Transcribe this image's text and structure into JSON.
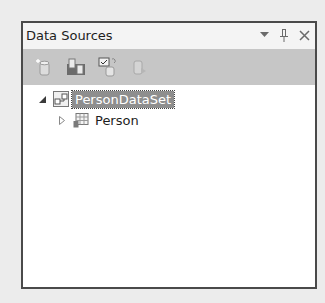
{
  "panel": {
    "title": "Data Sources",
    "title_buttons": [
      {
        "name": "window-position-dropdown",
        "icon": "chevron-down-icon",
        "glyph": "▾"
      },
      {
        "name": "auto-hide-pin",
        "icon": "pin-icon",
        "glyph": "🖈"
      },
      {
        "name": "close",
        "icon": "close-icon",
        "glyph": "✕"
      }
    ]
  },
  "toolbar": {
    "items": [
      {
        "name": "add-new-data-source",
        "icon": "database-add-icon"
      },
      {
        "name": "edit-dataset-with-designer",
        "icon": "dataset-designer-icon"
      },
      {
        "name": "configure-dataset-with-wizard",
        "icon": "dataset-wizard-icon"
      },
      {
        "name": "refresh",
        "icon": "database-refresh-icon"
      }
    ]
  },
  "tree": {
    "nodes": [
      {
        "label": "PersonDataSet",
        "expanded": true,
        "selected": true,
        "icon": "dataset-icon",
        "level": 0
      },
      {
        "label": "Person",
        "expanded": false,
        "selected": false,
        "icon": "table-icon",
        "level": 1
      }
    ]
  },
  "colors": {
    "selection_bg": "#8e8e8e",
    "toolbar_bg": "#c6c6c6",
    "border": "#4a4a4a"
  }
}
